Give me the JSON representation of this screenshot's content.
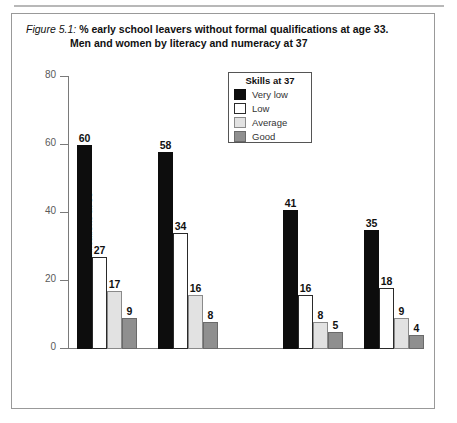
{
  "figure": {
    "label": "Figure 5.1:",
    "title_line1": "% early school leavers without formal qualifications at age 33.",
    "title_line2": "Men and women by literacy and numeracy at 37"
  },
  "legend": {
    "title": "Skills at 37",
    "items": [
      {
        "label": "Very low",
        "swatch": "verylow",
        "color": "#0d0d0d"
      },
      {
        "label": "Low",
        "swatch": "low",
        "color": "#ffffff"
      },
      {
        "label": "Average",
        "swatch": "average",
        "color": "#e2e2e2"
      },
      {
        "label": "Good",
        "swatch": "good",
        "color": "#8f8f8f"
      }
    ]
  },
  "chart_data": {
    "type": "bar",
    "title": "% early school leavers without formal qualifications at age 33. Men and women by literacy and numeracy at 37",
    "xlabel": "",
    "ylabel": "% without qualifications at 33",
    "ylim": [
      0,
      80
    ],
    "yticks": [
      0,
      20,
      40,
      60,
      80
    ],
    "ytick_labels": [
      "0",
      "20",
      "40",
      "60",
      "80"
    ],
    "grid": false,
    "legend_position": "top-center",
    "sections": [
      "LITERACY",
      "NUMERACY"
    ],
    "categories": [
      "Men",
      "Women",
      "Men",
      "Women"
    ],
    "category_sections": [
      "LITERACY",
      "LITERACY",
      "NUMERACY",
      "NUMERACY"
    ],
    "series": [
      {
        "name": "Very low",
        "color": "#0d0d0d",
        "values": [
          60,
          58,
          41,
          35
        ]
      },
      {
        "name": "Low",
        "color": "#ffffff",
        "values": [
          27,
          34,
          16,
          18
        ]
      },
      {
        "name": "Average",
        "color": "#e2e2e2",
        "values": [
          17,
          16,
          8,
          9
        ]
      },
      {
        "name": "Good",
        "color": "#8f8f8f",
        "values": [
          9,
          8,
          5,
          4
        ]
      }
    ]
  }
}
